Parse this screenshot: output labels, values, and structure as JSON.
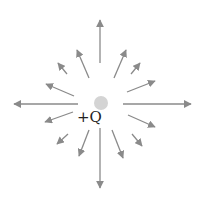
{
  "diagram": {
    "charge": {
      "label": "+Q",
      "cx": 101,
      "cy": 103,
      "r": 7,
      "color": "#d4d4d4"
    },
    "arrow_color": "#8a8a8a",
    "arrows": [
      {
        "x1": 100,
        "y1": 63,
        "x2": 100,
        "y2": 20
      },
      {
        "x1": 89,
        "y1": 78,
        "x2": 77,
        "y2": 50
      },
      {
        "x1": 114,
        "y1": 78,
        "x2": 126,
        "y2": 50
      },
      {
        "x1": 67,
        "y1": 74,
        "x2": 58,
        "y2": 63
      },
      {
        "x1": 131,
        "y1": 74,
        "x2": 140,
        "y2": 63
      },
      {
        "x1": 74,
        "y1": 96,
        "x2": 46,
        "y2": 84
      },
      {
        "x1": 127,
        "y1": 92,
        "x2": 155,
        "y2": 81
      },
      {
        "x1": 78,
        "y1": 104,
        "x2": 14,
        "y2": 104
      },
      {
        "x1": 123,
        "y1": 104,
        "x2": 191,
        "y2": 104
      },
      {
        "x1": 73,
        "y1": 112,
        "x2": 45,
        "y2": 122
      },
      {
        "x1": 128,
        "y1": 115,
        "x2": 155,
        "y2": 127
      },
      {
        "x1": 68,
        "y1": 134,
        "x2": 57,
        "y2": 144
      },
      {
        "x1": 132,
        "y1": 134,
        "x2": 142,
        "y2": 146
      },
      {
        "x1": 89,
        "y1": 130,
        "x2": 79,
        "y2": 156
      },
      {
        "x1": 112,
        "y1": 130,
        "x2": 123,
        "y2": 158
      },
      {
        "x1": 100,
        "y1": 128,
        "x2": 100,
        "y2": 188
      }
    ]
  }
}
